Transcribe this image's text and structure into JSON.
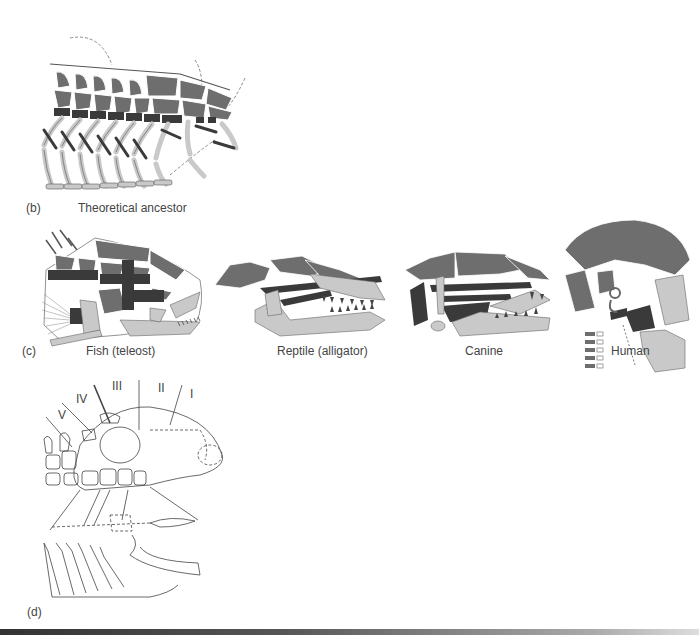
{
  "figure": {
    "colors": {
      "dark": "#3a3a3a",
      "medium": "#6e6e6e",
      "light": "#c9c9c9",
      "line": "#555555"
    },
    "panel_b": {
      "letter": "(b)",
      "caption": "Theoretical ancestor"
    },
    "panel_c": {
      "letter": "(c)",
      "specimens": [
        {
          "caption": "Fish (teleost)"
        },
        {
          "caption": "Reptile (alligator)"
        },
        {
          "caption": "Canine"
        },
        {
          "caption": "Human"
        }
      ]
    },
    "panel_d": {
      "letter": "(d)",
      "arch_labels": [
        "V",
        "IV",
        "III",
        "II",
        "I"
      ]
    }
  }
}
